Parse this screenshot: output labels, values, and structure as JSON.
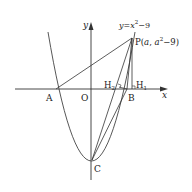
{
  "diagram": {
    "curve_label": {
      "prefix": "y=x",
      "exp": "2",
      "suffix": "−9"
    },
    "axes": {
      "x_label": "x",
      "y_label": "y"
    },
    "points": {
      "A": "A",
      "O": "O",
      "B": "B",
      "C": "C",
      "P": {
        "name": "P",
        "coord_open": "(",
        "a": "a",
        "sep": ", ",
        "a2": "a",
        "exp": "2",
        "tail": "−9)"
      },
      "H1": {
        "name": "H",
        "sub": "1"
      },
      "H2": {
        "name": "H",
        "sub": "2"
      }
    },
    "colors": {
      "stroke": "#333333",
      "background": "#ffffff"
    }
  }
}
